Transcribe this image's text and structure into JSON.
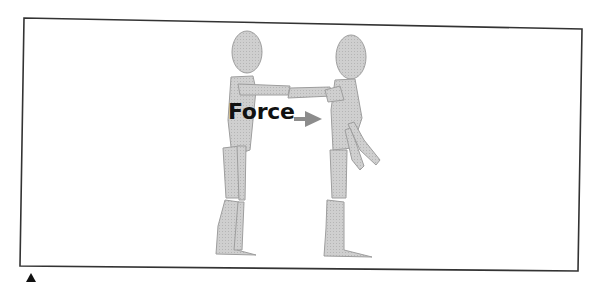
{
  "figure": {
    "label": "Force",
    "arrow_direction": "right",
    "figures_count": 2,
    "colors": {
      "frame": "#333333",
      "figure_fill": "#c8c8c8",
      "figure_stroke": "#a8a8a8",
      "arrow": "#8c8c8c",
      "label": "#111111"
    }
  },
  "caption_marker": "▲"
}
